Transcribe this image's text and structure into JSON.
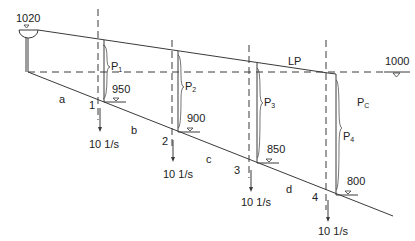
{
  "diagram": {
    "reservoir_elevation": "1020",
    "reference_elevation": "1000",
    "energy_line_label": "LP",
    "pressure_region_label": "P",
    "pressure_region_sub": "C",
    "pipes": [
      {
        "label": "a"
      },
      {
        "label": "b"
      },
      {
        "label": "c"
      },
      {
        "label": "d"
      }
    ],
    "nodes": [
      {
        "id": "1",
        "elevation": "950",
        "pressure": "P",
        "pressure_sub": "1",
        "demand": "10 1/s"
      },
      {
        "id": "2",
        "elevation": "900",
        "pressure": "P",
        "pressure_sub": "2",
        "demand": "10 1/s"
      },
      {
        "id": "3",
        "elevation": "850",
        "pressure": "P",
        "pressure_sub": "3",
        "demand": "10 1/s"
      },
      {
        "id": "4",
        "elevation": "800",
        "pressure": "P",
        "pressure_sub": "4",
        "demand": "10 1/s"
      }
    ],
    "colors": {
      "line": "#3a3a3a",
      "text": "#222222"
    }
  }
}
